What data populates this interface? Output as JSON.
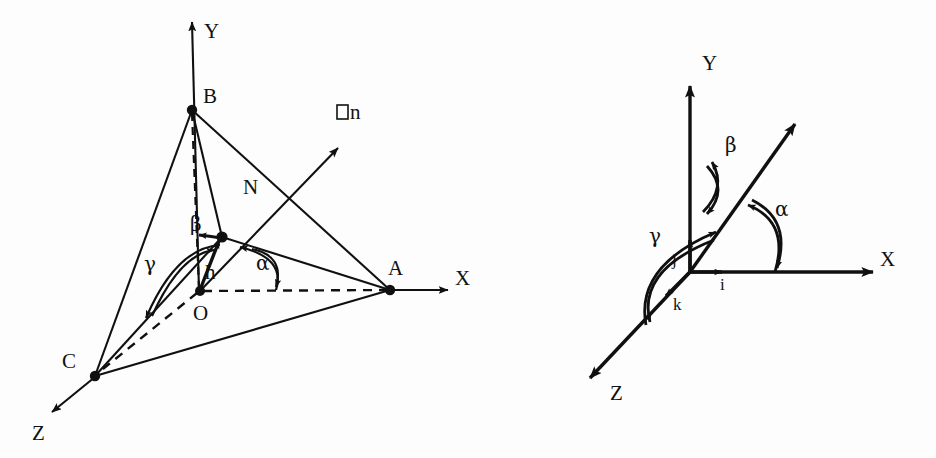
{
  "figure": {
    "background_color": "#fdfdfd",
    "ink_color": "#101010",
    "panels": [
      {
        "id": "left-panel",
        "name": "tetrahedron-direction-cosines-diagram",
        "description": "Tetrahedron OABC with normal N and direction angles alpha, beta, gamma",
        "labels": {
          "axis_y": "Y",
          "axis_x": "X",
          "axis_z": "Z",
          "vertex_a": "A",
          "vertex_b": "B",
          "vertex_c": "C",
          "origin": "O",
          "normal_n": "N",
          "normal_vector": "□n",
          "height_h": "h",
          "angle_alpha": "α",
          "angle_beta": "β",
          "angle_gamma": "γ"
        }
      },
      {
        "id": "right-panel",
        "name": "unit-vector-axes-diagram",
        "description": "Cartesian axes with unit vectors i, j, k and direction angles alpha, beta, gamma of an oblique vector",
        "labels": {
          "axis_y": "Y",
          "axis_x": "X",
          "axis_z": "Z",
          "unit_i": "i",
          "unit_j": "j",
          "unit_k": "k",
          "angle_alpha": "α",
          "angle_beta": "β",
          "angle_gamma": "γ"
        }
      }
    ]
  }
}
